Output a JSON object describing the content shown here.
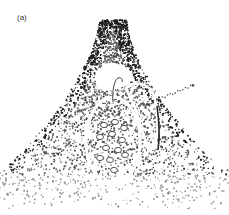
{
  "figure": {
    "panel_label": "(a)",
    "style": "stippled illustration",
    "ink_color": "#222222",
    "background": "#ffffff",
    "parts": [
      {
        "name": "outer-mound",
        "description": "stippled conical outer tissue"
      },
      {
        "name": "cavity",
        "description": "white cavity at top of mound"
      },
      {
        "name": "inner-body",
        "description": "oval inner body outlined with white band, containing ring-like cells"
      },
      {
        "name": "side-lobe",
        "description": "elongated lobe on right side"
      },
      {
        "name": "hook",
        "description": "curved filament at top of inner body"
      },
      {
        "name": "pointer",
        "description": "dotted line extending to upper right"
      }
    ]
  }
}
